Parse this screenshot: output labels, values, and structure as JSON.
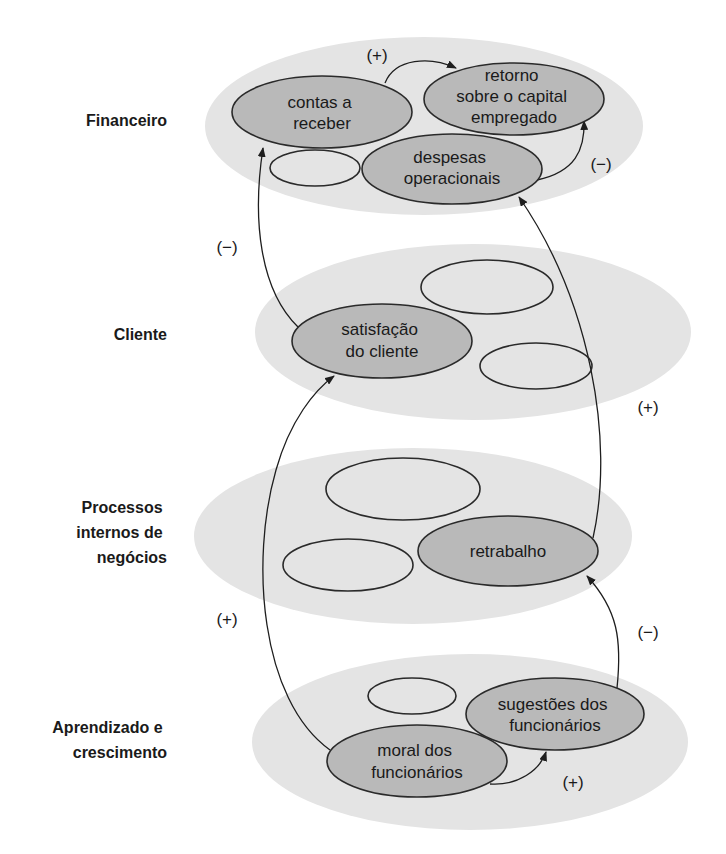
{
  "perspectives": [
    {
      "id": "financeiro",
      "label_lines": [
        "Financeiro"
      ]
    },
    {
      "id": "cliente",
      "label_lines": [
        "Cliente"
      ]
    },
    {
      "id": "processos",
      "label_lines": [
        "Processos",
        "internos de",
        "negócios"
      ]
    },
    {
      "id": "aprendizado",
      "label_lines": [
        "Aprendizado e",
        "crescimento"
      ]
    }
  ],
  "nodes": {
    "contas_a_receber": {
      "lines": [
        "contas a",
        "receber"
      ]
    },
    "retorno_capital": {
      "lines": [
        "retorno",
        "sobre o capital",
        "empregado"
      ]
    },
    "despesas_operacionais": {
      "lines": [
        "despesas",
        "operacionais"
      ]
    },
    "satisfacao_cliente": {
      "lines": [
        "satisfação",
        "do cliente"
      ]
    },
    "retrabalho": {
      "lines": [
        "retrabalho"
      ]
    },
    "sugestoes_funcionarios": {
      "lines": [
        "sugestões dos",
        "funcionários"
      ]
    },
    "moral_funcionarios": {
      "lines": [
        "moral dos",
        "funcionários"
      ]
    }
  },
  "links": [
    {
      "from": "contas_a_receber",
      "to": "retorno_capital",
      "sign": "(+)"
    },
    {
      "from": "despesas_operacionais",
      "to": "retorno_capital",
      "sign": "(−)"
    },
    {
      "from": "satisfacao_cliente",
      "to": "contas_a_receber",
      "sign": "(−)"
    },
    {
      "from": "retrabalho",
      "to": "despesas_operacionais",
      "sign": "(+)"
    },
    {
      "from": "moral_funcionarios",
      "to": "satisfacao_cliente",
      "sign": "(+)"
    },
    {
      "from": "sugestoes_funcionarios",
      "to": "retrabalho",
      "sign": "(−)"
    },
    {
      "from": "moral_funcionarios",
      "to": "sugestoes_funcionarios",
      "sign": "(+)"
    }
  ],
  "colors": {
    "band": "#e4e4e4",
    "node_fill": "#b9b9b9",
    "stroke": "#2a2a2a"
  }
}
